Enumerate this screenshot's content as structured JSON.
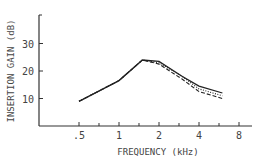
{
  "chart_data": {
    "type": "line",
    "title": "",
    "xlabel": "FREQUENCY (kHz)",
    "ylabel": "INSERTION GAIN (dB)",
    "x_scale": "log2",
    "x_ticks": [
      0.5,
      1,
      2,
      4,
      8
    ],
    "x_tick_labels": [
      ".5",
      "1",
      "2",
      "4",
      "8"
    ],
    "y_ticks": [
      10,
      20,
      30
    ],
    "y_tick_labels": [
      "10",
      "20",
      "30"
    ],
    "xlim": [
      0.25,
      10
    ],
    "ylim": [
      0,
      40
    ],
    "grid": false,
    "legend": null,
    "series": [
      {
        "name": "solid",
        "style": "solid",
        "x": [
          0.5,
          1,
          1.5,
          2,
          3,
          4,
          6
        ],
        "y": [
          9,
          16.5,
          24,
          23.5,
          18,
          14.5,
          12
        ]
      },
      {
        "name": "dashed",
        "style": "dashed",
        "x": [
          0.5,
          1,
          1.5,
          2,
          3,
          4,
          6
        ],
        "y": [
          9,
          16.5,
          24,
          22.5,
          17,
          12.5,
          10
        ]
      },
      {
        "name": "dotted",
        "style": "dotted",
        "x": [
          0.5,
          1,
          1.5,
          2,
          3,
          4,
          6
        ],
        "y": [
          9,
          16.5,
          24,
          23,
          18,
          13.5,
          11
        ]
      }
    ]
  }
}
